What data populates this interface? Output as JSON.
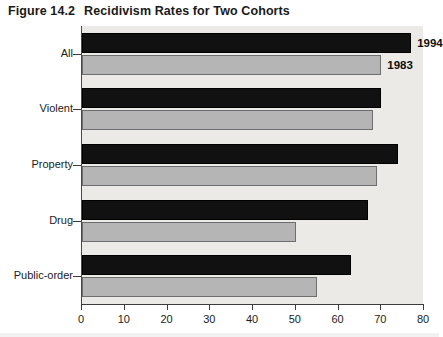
{
  "figure": {
    "number": "Figure 14.2",
    "title": "Recidivism Rates for Two Cohorts"
  },
  "chart_data": {
    "type": "bar",
    "orientation": "horizontal",
    "title": "Recidivism Rates for Two Cohorts",
    "xlabel": "",
    "ylabel": "",
    "xlim": [
      0,
      80
    ],
    "xticks": [
      0,
      10,
      20,
      30,
      40,
      50,
      60,
      70,
      80
    ],
    "xtick_labels": [
      "0",
      "10",
      "20",
      "30",
      "40",
      "50",
      "60",
      "70",
      "80"
    ],
    "grid": false,
    "legend": "inline-labels",
    "categories": [
      "All",
      "Violent",
      "Property",
      "Drug",
      "Public-order"
    ],
    "series": [
      {
        "name": "1994",
        "color": "#111111",
        "values": [
          77,
          70,
          74,
          67,
          63
        ]
      },
      {
        "name": "1983",
        "color": "#b5b5b5",
        "values": [
          70,
          68,
          69,
          50,
          55
        ]
      }
    ],
    "annotations": [
      {
        "text": "1994",
        "series": "1994",
        "category": "All"
      },
      {
        "text": "1983",
        "series": "1983",
        "category": "All"
      }
    ]
  }
}
